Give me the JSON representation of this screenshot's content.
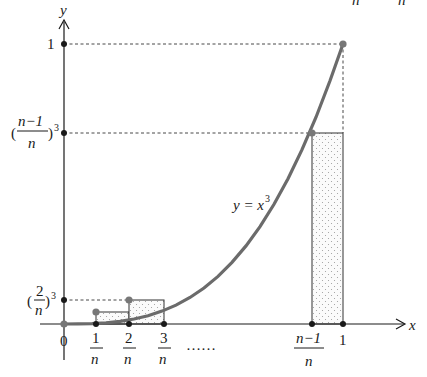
{
  "figure": {
    "axes": {
      "x_label": "x",
      "y_label": "y"
    },
    "curve_label": {
      "lhs": "y = x",
      "exp": "3"
    },
    "y_ticks": [
      {
        "id": "one",
        "label": "1"
      },
      {
        "id": "n1_cubed",
        "num": "n−1",
        "den": "n",
        "open": "(",
        "close": ")",
        "exp": "3"
      },
      {
        "id": "two_cubed",
        "num": "2",
        "den": "n",
        "open": "(",
        "close": ")",
        "exp": "3"
      }
    ],
    "x_ticks": [
      {
        "id": "zero",
        "label": "0"
      },
      {
        "id": "one_n",
        "num": "1",
        "den": "n"
      },
      {
        "id": "two_n",
        "num": "2",
        "den": "n"
      },
      {
        "id": "three_n",
        "num": "3",
        "den": "n"
      },
      {
        "id": "ellipsis",
        "label": "……"
      },
      {
        "id": "n1_n",
        "num": "n−1",
        "den": "n"
      },
      {
        "id": "one",
        "label": "1"
      }
    ],
    "top_clipped": {
      "left": "n",
      "right": "n"
    },
    "colors": {
      "curve": "#6b6b6b",
      "axis": "#1a1a1a",
      "fill": "#f4f4f4",
      "dot": "#1a1a1a",
      "curve_dot": "#777777"
    }
  }
}
